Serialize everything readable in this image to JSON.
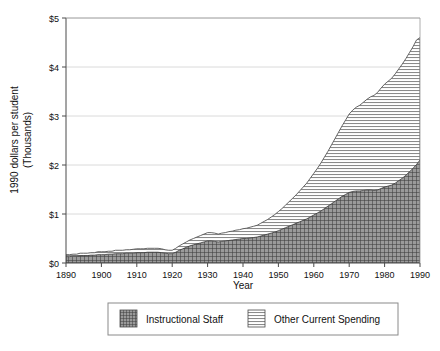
{
  "chart_data": {
    "type": "area",
    "stacked": true,
    "title": "",
    "xlabel": "Year",
    "ylabel": "1990 dollars per student (Thousands)",
    "ylabel_lines": [
      "1990 dollars per student",
      "(Thousands)"
    ],
    "xlim": [
      1890,
      1990
    ],
    "ylim": [
      0,
      5
    ],
    "ytick_labels": [
      "$0",
      "$1",
      "$2",
      "$3",
      "$4",
      "$5"
    ],
    "ytick_values": [
      0,
      1,
      2,
      3,
      4,
      5
    ],
    "xtick_labels": [
      "1890",
      "1900",
      "1910",
      "1920",
      "1930",
      "1940",
      "1950",
      "1960",
      "1970",
      "1980",
      "1990"
    ],
    "xtick_values": [
      1890,
      1900,
      1910,
      1920,
      1930,
      1940,
      1950,
      1960,
      1970,
      1980,
      1990
    ],
    "grid": "horizontal",
    "legend_position": "below",
    "x": [
      1890,
      1891,
      1892,
      1893,
      1894,
      1895,
      1896,
      1897,
      1898,
      1899,
      1900,
      1901,
      1902,
      1903,
      1904,
      1905,
      1906,
      1907,
      1908,
      1909,
      1910,
      1911,
      1912,
      1913,
      1914,
      1915,
      1916,
      1917,
      1918,
      1919,
      1920,
      1921,
      1922,
      1923,
      1924,
      1925,
      1926,
      1927,
      1928,
      1929,
      1930,
      1931,
      1932,
      1933,
      1934,
      1935,
      1936,
      1937,
      1938,
      1939,
      1940,
      1941,
      1942,
      1943,
      1944,
      1945,
      1946,
      1947,
      1948,
      1949,
      1950,
      1951,
      1952,
      1953,
      1954,
      1955,
      1956,
      1957,
      1958,
      1959,
      1960,
      1961,
      1962,
      1963,
      1964,
      1965,
      1966,
      1967,
      1968,
      1969,
      1970,
      1971,
      1972,
      1973,
      1974,
      1975,
      1976,
      1977,
      1978,
      1979,
      1980,
      1981,
      1982,
      1983,
      1984,
      1985,
      1986,
      1987,
      1988,
      1989,
      1990
    ],
    "series": [
      {
        "name": "Instructional Staff",
        "pattern": "crosshatch",
        "color": "#6e6e6e",
        "values": [
          0.13,
          0.13,
          0.14,
          0.14,
          0.15,
          0.15,
          0.15,
          0.16,
          0.16,
          0.17,
          0.17,
          0.17,
          0.18,
          0.18,
          0.19,
          0.19,
          0.19,
          0.2,
          0.2,
          0.2,
          0.21,
          0.21,
          0.21,
          0.22,
          0.22,
          0.22,
          0.22,
          0.21,
          0.2,
          0.19,
          0.19,
          0.22,
          0.26,
          0.29,
          0.32,
          0.35,
          0.37,
          0.39,
          0.41,
          0.43,
          0.45,
          0.45,
          0.44,
          0.43,
          0.44,
          0.45,
          0.46,
          0.47,
          0.48,
          0.49,
          0.5,
          0.5,
          0.51,
          0.52,
          0.53,
          0.55,
          0.57,
          0.59,
          0.61,
          0.63,
          0.66,
          0.69,
          0.72,
          0.75,
          0.78,
          0.81,
          0.84,
          0.87,
          0.9,
          0.94,
          0.98,
          1.02,
          1.06,
          1.11,
          1.16,
          1.21,
          1.26,
          1.31,
          1.36,
          1.4,
          1.44,
          1.46,
          1.47,
          1.47,
          1.48,
          1.49,
          1.49,
          1.48,
          1.49,
          1.52,
          1.55,
          1.57,
          1.59,
          1.63,
          1.68,
          1.73,
          1.79,
          1.86,
          1.93,
          2.01,
          2.1
        ]
      },
      {
        "name": "Other Current Spending",
        "pattern": "horizontal-lines",
        "color": "#c8c8c8",
        "values": [
          0.04,
          0.04,
          0.04,
          0.04,
          0.05,
          0.05,
          0.05,
          0.05,
          0.05,
          0.06,
          0.06,
          0.06,
          0.06,
          0.06,
          0.07,
          0.07,
          0.07,
          0.07,
          0.07,
          0.08,
          0.08,
          0.08,
          0.08,
          0.08,
          0.08,
          0.08,
          0.08,
          0.08,
          0.07,
          0.07,
          0.07,
          0.08,
          0.09,
          0.1,
          0.11,
          0.12,
          0.13,
          0.14,
          0.15,
          0.16,
          0.17,
          0.17,
          0.17,
          0.16,
          0.17,
          0.17,
          0.18,
          0.18,
          0.19,
          0.19,
          0.2,
          0.21,
          0.22,
          0.23,
          0.24,
          0.26,
          0.28,
          0.3,
          0.33,
          0.36,
          0.39,
          0.42,
          0.46,
          0.5,
          0.54,
          0.58,
          0.63,
          0.68,
          0.73,
          0.79,
          0.85,
          0.91,
          0.98,
          1.05,
          1.12,
          1.2,
          1.28,
          1.36,
          1.44,
          1.52,
          1.6,
          1.66,
          1.71,
          1.75,
          1.8,
          1.85,
          1.9,
          1.94,
          1.99,
          2.05,
          2.1,
          2.14,
          2.18,
          2.23,
          2.28,
          2.33,
          2.38,
          2.43,
          2.48,
          2.54,
          2.5
        ]
      }
    ],
    "totals": [
      0.17,
      0.17,
      0.18,
      0.18,
      0.2,
      0.2,
      0.2,
      0.21,
      0.21,
      0.23,
      0.23,
      0.23,
      0.24,
      0.24,
      0.26,
      0.26,
      0.26,
      0.27,
      0.27,
      0.28,
      0.29,
      0.29,
      0.29,
      0.3,
      0.3,
      0.3,
      0.3,
      0.29,
      0.27,
      0.26,
      0.26,
      0.3,
      0.35,
      0.39,
      0.43,
      0.47,
      0.5,
      0.53,
      0.56,
      0.59,
      0.62,
      0.62,
      0.61,
      0.59,
      0.61,
      0.62,
      0.64,
      0.65,
      0.67,
      0.68,
      0.7,
      0.71,
      0.73,
      0.75,
      0.77,
      0.81,
      0.85,
      0.89,
      0.94,
      0.99,
      1.05,
      1.11,
      1.18,
      1.25,
      1.32,
      1.39,
      1.47,
      1.55,
      1.63,
      1.73,
      1.83,
      1.93,
      2.04,
      2.16,
      2.28,
      2.41,
      2.54,
      2.67,
      2.8,
      2.92,
      3.04,
      3.12,
      3.18,
      3.22,
      3.28,
      3.34,
      3.39,
      3.42,
      3.48,
      3.57,
      3.65,
      3.71,
      3.77,
      3.86,
      3.96,
      4.06,
      4.17,
      4.29,
      4.41,
      4.55,
      4.6
    ]
  },
  "legend": {
    "items": [
      {
        "label": "Instructional Staff",
        "pattern": "crosshatch"
      },
      {
        "label": "Other Current Spending",
        "pattern": "horizontal-lines"
      }
    ]
  }
}
